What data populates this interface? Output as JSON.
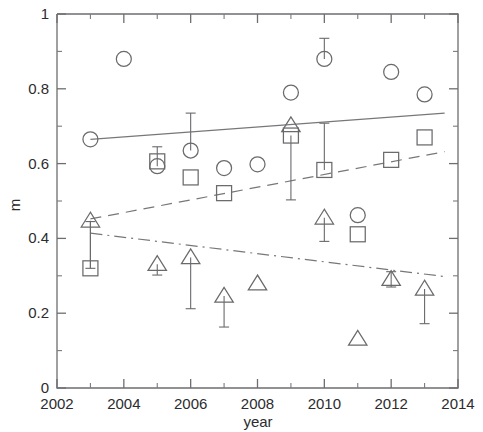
{
  "chart_data": {
    "type": "scatter",
    "title": "",
    "xlabel": "year",
    "ylabel": "m",
    "xlim": [
      2002,
      2014
    ],
    "ylim": [
      0,
      1
    ],
    "x_major_ticks": [
      2002,
      2004,
      2006,
      2008,
      2010,
      2012,
      2014
    ],
    "x_tick_labels": [
      "2002",
      "2004",
      "2006",
      "2008",
      "2010",
      "2012",
      "2014"
    ],
    "x_minor_ticks": [
      2003,
      2005,
      2007,
      2009,
      2011,
      2013
    ],
    "y_major_ticks": [
      0,
      0.2,
      0.4,
      0.6,
      0.8,
      1
    ],
    "y_tick_labels": [
      "0",
      "0.2",
      "0.4",
      "0.6",
      "0.8",
      "1"
    ],
    "y_minor_ticks": [
      0.1,
      0.3,
      0.5,
      0.7,
      0.9
    ],
    "grid": false,
    "legend": "none",
    "series": [
      {
        "name": "circle",
        "marker": "circle",
        "points": [
          {
            "x": 2003,
            "y": 0.665,
            "yerr_low": null,
            "yerr_high": null
          },
          {
            "x": 2004,
            "y": 0.88,
            "yerr_low": null,
            "yerr_high": null
          },
          {
            "x": 2005,
            "y": 0.593,
            "yerr_low": null,
            "yerr_high": 0.645
          },
          {
            "x": 2006,
            "y": 0.635,
            "yerr_low": null,
            "yerr_high": 0.735
          },
          {
            "x": 2007,
            "y": 0.588,
            "yerr_low": null,
            "yerr_high": null
          },
          {
            "x": 2008,
            "y": 0.598,
            "yerr_low": null,
            "yerr_high": null
          },
          {
            "x": 2009,
            "y": 0.79,
            "yerr_low": null,
            "yerr_high": null
          },
          {
            "x": 2010,
            "y": 0.88,
            "yerr_low": null,
            "yerr_high": 0.935
          },
          {
            "x": 2011,
            "y": 0.462,
            "yerr_low": null,
            "yerr_high": null
          },
          {
            "x": 2012,
            "y": 0.845,
            "yerr_low": null,
            "yerr_high": null
          },
          {
            "x": 2013,
            "y": 0.785,
            "yerr_low": null,
            "yerr_high": null
          }
        ]
      },
      {
        "name": "square",
        "marker": "square",
        "points": [
          {
            "x": 2003,
            "y": 0.32,
            "yerr_low": null,
            "yerr_high": 0.445
          },
          {
            "x": 2005,
            "y": 0.606,
            "yerr_low": null,
            "yerr_high": null
          },
          {
            "x": 2006,
            "y": 0.563,
            "yerr_low": null,
            "yerr_high": null
          },
          {
            "x": 2007,
            "y": 0.521,
            "yerr_low": null,
            "yerr_high": null
          },
          {
            "x": 2009,
            "y": 0.675,
            "yerr_low": 0.503,
            "yerr_high": null
          },
          {
            "x": 2010,
            "y": 0.583,
            "yerr_low": null,
            "yerr_high": 0.708
          },
          {
            "x": 2011,
            "y": 0.411,
            "yerr_low": null,
            "yerr_high": null
          },
          {
            "x": 2012,
            "y": 0.61,
            "yerr_low": null,
            "yerr_high": null
          },
          {
            "x": 2013,
            "y": 0.67,
            "yerr_low": null,
            "yerr_high": null
          }
        ]
      },
      {
        "name": "triangle",
        "marker": "triangle",
        "points": [
          {
            "x": 2003,
            "y": 0.447,
            "yerr_low": 0.32,
            "yerr_high": null
          },
          {
            "x": 2005,
            "y": 0.331,
            "yerr_low": 0.302,
            "yerr_high": null
          },
          {
            "x": 2006,
            "y": 0.349,
            "yerr_low": 0.212,
            "yerr_high": null
          },
          {
            "x": 2007,
            "y": 0.246,
            "yerr_low": 0.163,
            "yerr_high": null
          },
          {
            "x": 2008,
            "y": 0.279,
            "yerr_low": null,
            "yerr_high": null
          },
          {
            "x": 2009,
            "y": 0.702,
            "yerr_low": null,
            "yerr_high": null
          },
          {
            "x": 2010,
            "y": 0.455,
            "yerr_low": 0.392,
            "yerr_high": null
          },
          {
            "x": 2011,
            "y": 0.131,
            "yerr_low": null,
            "yerr_high": null
          },
          {
            "x": 2012,
            "y": 0.291,
            "yerr_low": 0.27,
            "yerr_high": 0.311
          },
          {
            "x": 2013,
            "y": 0.265,
            "yerr_low": 0.172,
            "yerr_high": null
          }
        ]
      }
    ],
    "trend_lines": [
      {
        "name": "solid-trend",
        "style": "solid",
        "x0": 2003,
        "y0": 0.665,
        "x1": 2013.6,
        "y1": 0.735
      },
      {
        "name": "dashed-trend",
        "style": "dashed",
        "x0": 2003,
        "y0": 0.452,
        "x1": 2013.6,
        "y1": 0.632
      },
      {
        "name": "dashdot-trend",
        "style": "dashdot",
        "x0": 2003,
        "y0": 0.414,
        "x1": 2013.6,
        "y1": 0.298
      }
    ]
  }
}
